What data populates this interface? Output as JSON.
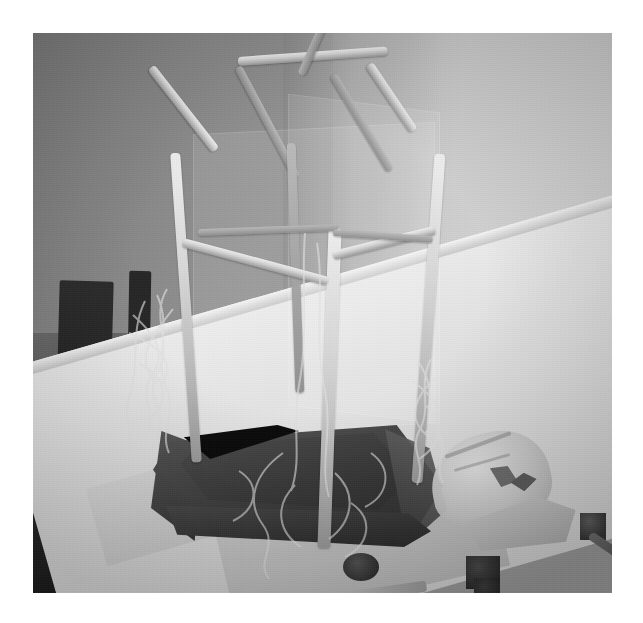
{
  "image": {
    "domain": "Natural-Image",
    "title": "Model greenhouse frame built from rolled paper tubes on a white table",
    "canvas_width": 643,
    "canvas_height": 623,
    "photo_bounds": {
      "left": 33,
      "top": 33,
      "width": 579,
      "height": 560
    },
    "page_background": "#ffffff",
    "overall_tone": "grainy low-light grayscale photograph"
  },
  "palette": {
    "page_white": "#ffffff",
    "wall_left_gray": "#8a8a8a",
    "wall_right_gray": "#d4d4d4",
    "table_white": "#e8e8e8",
    "tray_dark": "#3a3a3a",
    "tray_void_black": "#0b0b0b",
    "stick_highlight": "#efefef",
    "stick_shadow": "#9c9c9c",
    "chair_black": "#1d1d1d",
    "string_gray": "#e1e1e1"
  },
  "scene": {
    "subject": "model-greenhouse-frame",
    "subject_description": "A tall house-shaped skeletal frame made from rolled newspaper or paper tubes, forming four corner posts, horizontal rails and a pitched gable roof, standing inside a dark rectangular tray.",
    "background": {
      "wall_left_label": "dim gray wall, left",
      "wall_right_label": "bright gray wall, right",
      "chairs_label": "dark wooden chair backs and spindles"
    },
    "surface": {
      "label": "white table top",
      "covering": "white paper / tablecloth"
    }
  },
  "objects": [
    {
      "name": "frame-roof-ridge",
      "label": "roof ridge bar",
      "note": "horizontal top bar of the gable"
    },
    {
      "name": "frame-roof-left-slope",
      "label": "left roof slope"
    },
    {
      "name": "frame-roof-right-slope",
      "label": "right roof slope"
    },
    {
      "name": "frame-roof-front-gable",
      "label": "front gable peak"
    },
    {
      "name": "frame-post-front",
      "label": "front corner post"
    },
    {
      "name": "frame-post-left",
      "label": "left rear post"
    },
    {
      "name": "frame-post-right",
      "label": "right rear post"
    },
    {
      "name": "frame-rail-left",
      "label": "left eave rail"
    },
    {
      "name": "frame-rail-right",
      "label": "right eave rail"
    },
    {
      "name": "base-tray",
      "label": "dark plastic tray base"
    },
    {
      "name": "string-bundle-left",
      "label": "tangle of string on the left"
    },
    {
      "name": "string-bundle-right",
      "label": "tangle of string on the right"
    },
    {
      "name": "plastic-bag",
      "label": "crumpled plastic bag"
    },
    {
      "name": "paper-scrap",
      "label": "paper scrap / napkin"
    },
    {
      "name": "bottle-cap-front",
      "label": "dark bottle cap, front"
    },
    {
      "name": "bottle-cap-right",
      "label": "dark bottle cap, right"
    },
    {
      "name": "hand-tool",
      "label": "small dark tool on the table"
    },
    {
      "name": "chair-left",
      "label": "left chair back"
    },
    {
      "name": "chair-right",
      "label": "right chair spindles"
    }
  ],
  "frame_geometry": {
    "sticks": [
      {
        "id": "roof-ridge",
        "left": 205,
        "top": 24,
        "w": 150,
        "h": 9,
        "rot": -4,
        "tone": "bright"
      },
      {
        "id": "gable-left-upper",
        "left": 118,
        "top": 30,
        "w": 105,
        "h": 9,
        "rot": 52,
        "tone": "bright"
      },
      {
        "id": "gable-right-upper",
        "left": 336,
        "top": 27,
        "w": 80,
        "h": 9,
        "rot": 56,
        "tone": "bright"
      },
      {
        "id": "front-peak-left",
        "left": 205,
        "top": 30,
        "w": 125,
        "h": 8,
        "rot": 62,
        "tone": "dim"
      },
      {
        "id": "front-peak-right",
        "left": 268,
        "top": 38,
        "w": 120,
        "h": 8,
        "rot": -66,
        "tone": "dim"
      },
      {
        "id": "rear-peak-left",
        "left": 300,
        "top": 38,
        "w": 112,
        "h": 8,
        "rot": 59,
        "tone": "dim"
      },
      {
        "id": "post-left",
        "left": 148,
        "top": 120,
        "w": 10,
        "h": 310,
        "rot": -4,
        "tone": "bright"
      },
      {
        "id": "post-front",
        "left": 290,
        "top": 195,
        "w": 13,
        "h": 320,
        "rot": 2,
        "tone": "bright"
      },
      {
        "id": "post-right",
        "left": 390,
        "top": 120,
        "w": 11,
        "h": 330,
        "rot": 4,
        "tone": "bright"
      },
      {
        "id": "post-rear",
        "left": 258,
        "top": 110,
        "w": 9,
        "h": 250,
        "rot": -2,
        "tone": "dim"
      },
      {
        "id": "rail-left",
        "left": 150,
        "top": 205,
        "w": 150,
        "h": 9,
        "rot": 15,
        "tone": "bright"
      },
      {
        "id": "rail-right",
        "left": 300,
        "top": 218,
        "w": 105,
        "h": 9,
        "rot": -14,
        "tone": "bright"
      },
      {
        "id": "rail-rear",
        "left": 165,
        "top": 196,
        "w": 140,
        "h": 7,
        "rot": -2,
        "tone": "dim"
      },
      {
        "id": "rail-rear-right",
        "left": 300,
        "top": 196,
        "w": 100,
        "h": 7,
        "rot": 4,
        "tone": "dim"
      }
    ]
  },
  "chart_data": null
}
